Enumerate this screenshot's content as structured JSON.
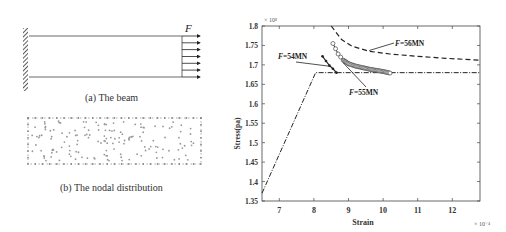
{
  "left_panel": {
    "beam": {
      "force_label": "F",
      "caption": "(a) The beam",
      "arrow_count": 7
    },
    "nodal": {
      "caption": "(b) The nodal distribution"
    }
  },
  "chart_data": {
    "type": "line",
    "title": "",
    "xlabel": "Strain",
    "ylabel": "Stress(pa)",
    "x_multiplier": "× 10⁻⁴",
    "y_multiplier": "× 10⁸",
    "xlim": [
      6.5,
      12.8
    ],
    "ylim": [
      1.35,
      1.8
    ],
    "x_ticks": [
      "7",
      "8",
      "9",
      "10",
      "11",
      "12"
    ],
    "y_ticks": [
      "1.35",
      "1.4",
      "1.45",
      "1.5",
      "1.55",
      "1.6",
      "1.65",
      "1.7",
      "1.75",
      "1.8"
    ],
    "grid": false,
    "series": [
      {
        "name": "Material curve",
        "style": "dash-dot",
        "x": [
          6.5,
          8.05,
          12.8
        ],
        "y": [
          1.37,
          1.68,
          1.68
        ]
      },
      {
        "name": "F=54MN",
        "style": "dots",
        "x": [
          8.25,
          8.35,
          8.45,
          8.55,
          8.65
        ],
        "y": [
          1.722,
          1.71,
          1.698,
          1.69,
          1.68
        ]
      },
      {
        "name": "F=55MN",
        "style": "circles",
        "x": [
          8.55,
          8.7,
          8.85,
          9.0,
          9.2,
          9.4,
          9.6,
          9.8,
          10.0,
          10.2
        ],
        "y": [
          1.755,
          1.728,
          1.712,
          1.703,
          1.697,
          1.693,
          1.689,
          1.686,
          1.683,
          1.679
        ]
      },
      {
        "name": "F=56MN",
        "style": "dashed",
        "x": [
          8.5,
          8.8,
          9.1,
          9.6,
          10.2,
          11.0,
          11.8,
          12.8
        ],
        "y": [
          1.8,
          1.765,
          1.748,
          1.735,
          1.728,
          1.722,
          1.717,
          1.712
        ]
      }
    ],
    "annotations": [
      {
        "text": "F=54MN",
        "italic_prefix": "F",
        "rest": "=54MN"
      },
      {
        "text": "F=55MN",
        "italic_prefix": "F",
        "rest": "=55MN"
      },
      {
        "text": "F=56MN",
        "italic_prefix": "F",
        "rest": "=56MN"
      }
    ]
  }
}
